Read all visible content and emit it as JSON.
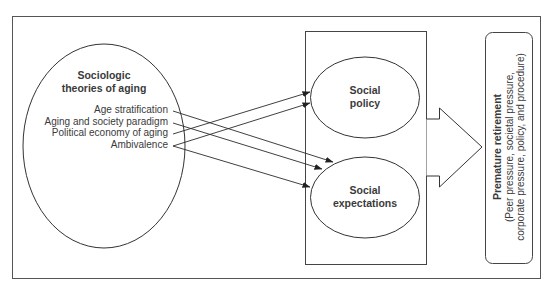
{
  "diagram": {
    "source_node": {
      "title_line1": "Sociologic",
      "title_line2": "theories of aging",
      "theories": [
        {
          "label": "Age stratification"
        },
        {
          "label": "Aging and society paradigm"
        },
        {
          "label": "Political economy of aging"
        },
        {
          "label": "Ambivalence"
        }
      ]
    },
    "mediators": [
      {
        "line1": "Social",
        "line2": "policy"
      },
      {
        "line1": "Social",
        "line2": "expectations"
      }
    ],
    "outcome": {
      "title": "Premature retirement",
      "detail_line1": "(Peer pressure, societal pressure,",
      "detail_line2": "corporate pressure, policy, and procedure)"
    },
    "connections": [
      {
        "from": "Political economy of aging",
        "to": "Social policy"
      },
      {
        "from": "Ambivalence",
        "to": "Social policy"
      },
      {
        "from": "Age stratification",
        "to": "Social expectations"
      },
      {
        "from": "Aging and society paradigm",
        "to": "Social expectations"
      },
      {
        "from": "Ambivalence",
        "to": "Social expectations"
      },
      {
        "from": "Social policy + Social expectations",
        "to": "Premature retirement"
      }
    ],
    "colors": {
      "stroke": "#333333",
      "text": "#3a3a3a",
      "background": "#ffffff"
    }
  }
}
